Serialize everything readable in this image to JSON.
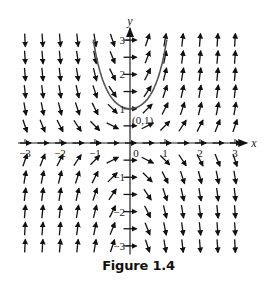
{
  "figure": {
    "caption": "Figure 1.4",
    "equation_note": "Slope field of dy/dx = 2xy with solution curve y = e^(x^2) through (0,1)",
    "point_label": "(0,1)"
  },
  "chart_data": {
    "type": "slope_field",
    "title": "",
    "xlabel": "x",
    "ylabel": "y",
    "xlim": [
      -3,
      3
    ],
    "ylim": [
      -3,
      3
    ],
    "x_ticks": [
      -3,
      -2,
      -1,
      0,
      1,
      2,
      3
    ],
    "x_tick_labels": [
      "−3",
      "−2",
      "−1",
      "0",
      "1",
      "2",
      "3"
    ],
    "y_ticks": [
      3,
      2,
      1,
      -1,
      -2,
      -3
    ],
    "y_tick_labels": [
      "3",
      "2",
      "1",
      "−1",
      "−2",
      "−3"
    ],
    "field": {
      "dx": 1,
      "dy_expr": "2*x*y",
      "grid_step": 0.5
    },
    "solution_curve": {
      "expr": "exp(x^2)",
      "x_range": [
        -1.05,
        1.05
      ],
      "passes_through": [
        0,
        1
      ]
    },
    "grid": false,
    "legend": null
  },
  "layout": {
    "origin_px": [
      130,
      143
    ],
    "unit_px_x": 35,
    "unit_px_y": 34.3,
    "arrow_color": "#111111",
    "curve_color": "#555555",
    "axis_color": "#222222"
  }
}
